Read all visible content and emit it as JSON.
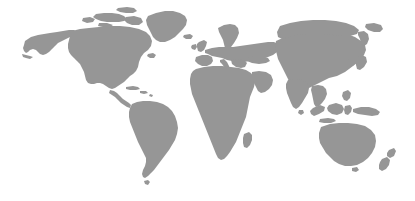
{
  "figure": {
    "kind": "world-map",
    "title": "World Map",
    "projection": "equirectangular",
    "width": 415,
    "height": 201,
    "background_color": "#ffffff",
    "land_color": "#969696",
    "has_labels": false,
    "has_borders": false,
    "has_graticule": false,
    "has_legend": false,
    "includes_antarctica": false,
    "alt_text": "Gray silhouette world map on a white background showing all continents except Antarctica"
  },
  "regions": [
    {
      "id": "north-america",
      "label": "North America"
    },
    {
      "id": "alaska",
      "label": "Alaska"
    },
    {
      "id": "canadian-arctic",
      "label": "Canadian Arctic Archipelago"
    },
    {
      "id": "greenland",
      "label": "Greenland"
    },
    {
      "id": "iceland",
      "label": "Iceland"
    },
    {
      "id": "central-america",
      "label": "Central America"
    },
    {
      "id": "caribbean",
      "label": "Caribbean Islands"
    },
    {
      "id": "south-america",
      "label": "South America"
    },
    {
      "id": "europe",
      "label": "Europe"
    },
    {
      "id": "british-isles",
      "label": "British Isles"
    },
    {
      "id": "scandinavia",
      "label": "Scandinavia"
    },
    {
      "id": "africa",
      "label": "Africa"
    },
    {
      "id": "madagascar",
      "label": "Madagascar"
    },
    {
      "id": "middle-east",
      "label": "Middle East"
    },
    {
      "id": "asia",
      "label": "Asia"
    },
    {
      "id": "india",
      "label": "India"
    },
    {
      "id": "southeast-asia",
      "label": "Southeast Asia"
    },
    {
      "id": "japan",
      "label": "Japan"
    },
    {
      "id": "indonesia",
      "label": "Indonesia"
    },
    {
      "id": "new-guinea",
      "label": "New Guinea"
    },
    {
      "id": "australia",
      "label": "Australia"
    },
    {
      "id": "new-zealand",
      "label": "New Zealand"
    }
  ]
}
